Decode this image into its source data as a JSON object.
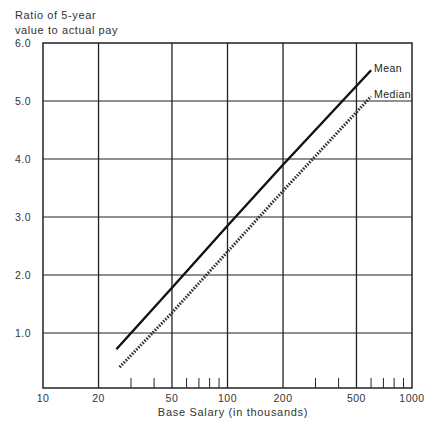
{
  "chart_data": {
    "type": "line",
    "title": "",
    "ylabel": "Ratio of 5-year value to actual pay",
    "ylabel_lines": [
      "Ratio of 5-year",
      "value to actual pay"
    ],
    "xlabel": "Base Salary (in thousands)",
    "xscale": "log",
    "xlim": [
      10,
      1000
    ],
    "ylim": [
      0,
      6.0
    ],
    "grid": true,
    "x_tick_labels": [
      "10",
      "20",
      "50",
      "100",
      "200",
      "500",
      "1000"
    ],
    "x_tick_values": [
      10,
      20,
      50,
      100,
      200,
      500,
      1000
    ],
    "x_minor_ticks": [
      30,
      40,
      60,
      70,
      80,
      90,
      300,
      400,
      600,
      700,
      800,
      900
    ],
    "y_tick_labels": [
      "1.0",
      "2.0",
      "3.0",
      "4.0",
      "5.0",
      "6.0"
    ],
    "y_tick_values": [
      1,
      2,
      3,
      4,
      5,
      6
    ],
    "legend_position": "inline at line ends",
    "series": [
      {
        "name": "Mean",
        "style": "solid",
        "x": [
          25,
          50,
          100,
          200,
          600
        ],
        "y": [
          0.72,
          1.78,
          2.85,
          3.9,
          5.53
        ]
      },
      {
        "name": "Median",
        "style": "dotted",
        "x": [
          26,
          50,
          100,
          200,
          600
        ],
        "y": [
          0.41,
          1.35,
          2.4,
          3.45,
          5.08
        ]
      }
    ]
  },
  "labels": {
    "ylabel_line1": "Ratio of 5-year",
    "ylabel_line2": "value to actual pay",
    "xtitle": "Base Salary (in thousands)",
    "mean": "Mean",
    "median": "Median"
  }
}
